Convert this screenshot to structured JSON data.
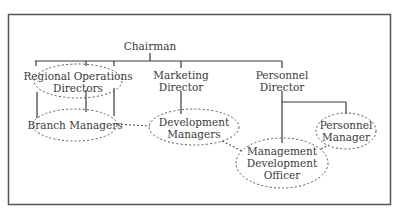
{
  "title": "",
  "colors": {
    "line": "#3a3a3a",
    "frame": "#555555",
    "dashed": "#555555",
    "text": "#3a3a3a",
    "background": "#ffffff"
  },
  "nodes": {
    "chairman": {
      "lines": [
        "Chairman"
      ]
    },
    "regional_ops": {
      "lines": [
        "Regional Operations",
        "Directors"
      ],
      "style": "dashed-ellipse"
    },
    "marketing": {
      "lines": [
        "Marketing",
        "Director"
      ]
    },
    "personnel_director": {
      "lines": [
        "Personnel",
        "Director"
      ]
    },
    "branch_managers": {
      "lines": [
        "Branch Managers"
      ],
      "style": "dashed-ellipse"
    },
    "development_managers": {
      "lines": [
        "Development",
        "Managers"
      ],
      "style": "dashed-ellipse"
    },
    "personnel_manager": {
      "lines": [
        "Personnel",
        "Manager"
      ],
      "style": "dashed-ellipse"
    },
    "mgmt_dev_officer": {
      "lines": [
        "Management",
        "Development",
        "Officer"
      ],
      "style": "dashed-ellipse"
    }
  },
  "edges": {
    "solid": [
      [
        "chairman",
        "regional_ops"
      ],
      [
        "chairman",
        "marketing"
      ],
      [
        "chairman",
        "personnel_director"
      ],
      [
        "regional_ops",
        "branch_managers"
      ],
      [
        "marketing",
        "development_managers"
      ],
      [
        "personnel_director",
        "mgmt_dev_officer"
      ],
      [
        "personnel_director",
        "personnel_manager"
      ]
    ],
    "dashed": [
      [
        "branch_managers",
        "development_managers"
      ],
      [
        "development_managers",
        "mgmt_dev_officer"
      ],
      [
        "mgmt_dev_officer",
        "personnel_manager"
      ]
    ]
  }
}
